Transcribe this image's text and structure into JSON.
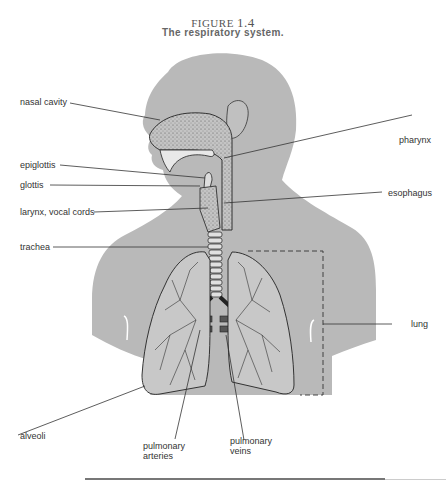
{
  "figure": {
    "label_prefix": "FIGURE",
    "number": "1.4",
    "title": "The respiratory system."
  },
  "colors": {
    "body_fill": "#b9b9b9",
    "line": "#333333",
    "label_text": "#333333"
  },
  "labels": {
    "nasal_cavity": "nasal cavity",
    "epiglottis": "epiglottis",
    "glottis": "glottis",
    "larynx": "larynx, vocal cords",
    "trachea": "trachea",
    "alveoli": "alveoli",
    "pharynx": "pharynx",
    "esophagus": "esophagus",
    "lung": "lung",
    "pulmonary_arteries_1": "pulmonary",
    "pulmonary_arteries_2": "arteries",
    "pulmonary_veins_1": "pulmonary",
    "pulmonary_veins_2": "veins"
  }
}
